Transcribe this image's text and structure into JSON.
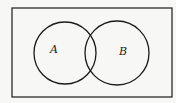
{
  "diagram": {
    "type": "venn",
    "universe": {
      "x": 12,
      "y": 8,
      "width": 160,
      "height": 89,
      "stroke": "#1a1a1a"
    },
    "sets": [
      {
        "label": "A",
        "cx": 65,
        "cy": 53,
        "r": 31,
        "label_x": 54,
        "label_y": 53
      },
      {
        "label": "B",
        "cx": 117,
        "cy": 53,
        "r": 32,
        "label_x": 123,
        "label_y": 55
      }
    ]
  }
}
